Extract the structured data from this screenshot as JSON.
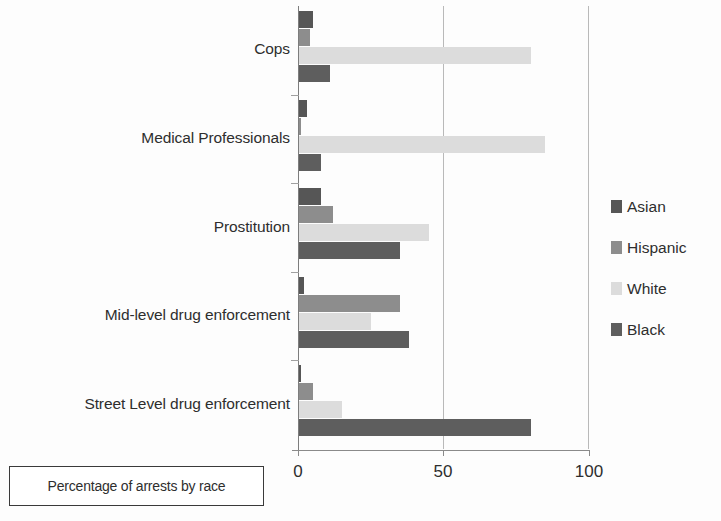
{
  "caption": {
    "text": "Percentage of arrests by race"
  },
  "legend": {
    "position": "right",
    "items": [
      {
        "label": "Asian",
        "key": "asian",
        "color": "#565656"
      },
      {
        "label": "Hispanic",
        "key": "hispanic",
        "color": "#8d8d8d"
      },
      {
        "label": "White",
        "key": "white",
        "color": "#dcdcdc"
      },
      {
        "label": "Black",
        "key": "black",
        "color": "#5e5e5e"
      }
    ]
  },
  "axis": {
    "x_ticks": [
      "0",
      "50",
      "100"
    ],
    "x_tick_values": [
      0,
      50,
      100
    ]
  },
  "chart_data": {
    "type": "bar",
    "orientation": "horizontal",
    "grouped": true,
    "title": "",
    "subtitle": "",
    "xlabel": "",
    "ylabel": "",
    "xlim": [
      0,
      100
    ],
    "grid": true,
    "grid_axis": "x",
    "legend_position": "right",
    "annotations": [
      "Percentage of arrests by race"
    ],
    "categories": [
      "Cops",
      "Medical Professionals",
      "Prostitution",
      "Mid-level drug enforcement",
      "Street Level drug enforcement"
    ],
    "series": [
      {
        "name": "Asian",
        "color": "#565656",
        "values": [
          5,
          3,
          8,
          2,
          1
        ]
      },
      {
        "name": "Hispanic",
        "color": "#8d8d8d",
        "values": [
          4,
          1,
          12,
          35,
          5
        ]
      },
      {
        "name": "White",
        "color": "#dcdcdc",
        "values": [
          80,
          85,
          45,
          25,
          15
        ]
      },
      {
        "name": "Black",
        "color": "#5e5e5e",
        "values": [
          11,
          8,
          35,
          38,
          80
        ]
      }
    ]
  }
}
